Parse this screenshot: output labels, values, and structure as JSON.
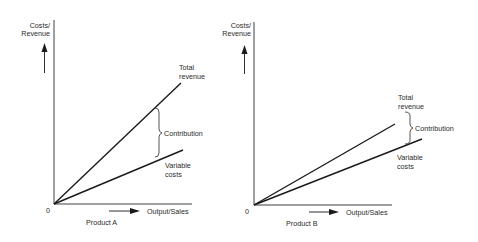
{
  "diagram": {
    "type": "contribution-comparison",
    "colors": {
      "line": "#1a1a1a",
      "axis": "#2a2a2a",
      "text": "#2a2a2a",
      "background": "#ffffff"
    },
    "panels": [
      {
        "id": "product-a",
        "y_label_line1": "Costs/",
        "y_label_line2": "Revenue",
        "x_label": "Output/Sales",
        "origin_label": "0",
        "product_label": "Product A",
        "total_revenue_line1": "Total",
        "total_revenue_line2": "revenue",
        "contribution_label": "Contribution",
        "variable_costs_line1": "Variable",
        "variable_costs_line2": "costs"
      },
      {
        "id": "product-b",
        "y_label_line1": "Costs/",
        "y_label_line2": "Revenue",
        "x_label": "Output/Sales",
        "origin_label": "0",
        "product_label": "Product B",
        "total_revenue_line1": "Total",
        "total_revenue_line2": "revenue",
        "contribution_label": "Contribution",
        "variable_costs_line1": "Variable",
        "variable_costs_line2": "costs"
      }
    ]
  }
}
